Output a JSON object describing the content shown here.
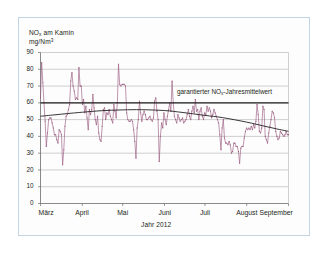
{
  "figure": {
    "frame_border_color": "#c3d5e2",
    "background_color": "#fdfdfd"
  },
  "chart_data": {
    "type": "line",
    "title": "",
    "ylabel_line1": "NOx am Kamin",
    "ylabel_line2": "mg/Nm3",
    "ylabel_line1_html": "NO<sub>x</sub> am Kamin",
    "ylabel_line2_html": "mg/Nm<sup>3</sup>",
    "xlabel": "Jahr 2012",
    "ylim": [
      0,
      90
    ],
    "yticks": [
      0,
      10,
      20,
      30,
      40,
      50,
      60,
      70,
      80,
      90
    ],
    "ytick_labels": [
      "0",
      "10",
      "20",
      "30",
      "40",
      "50",
      "60",
      "70",
      "80",
      "90"
    ],
    "xtick_labels": [
      "März",
      "April",
      "Mai",
      "Juni",
      "Juli",
      "August",
      "September"
    ],
    "xtick_positions_days": [
      0,
      31,
      61,
      92,
      122,
      153,
      184
    ],
    "x_range_days": [
      0,
      184
    ],
    "grid": "horizontal-only",
    "legend": "none",
    "series_color": "#9b5c82",
    "trend_color": "#221f1f",
    "threshold_color": "#221f1f",
    "annotations": [
      {
        "text": "garantierter NOx-Jahresmittelwert",
        "text_html": "garantierter NO<sub>x</sub>-Jahresmittelwert",
        "value": 60,
        "kind": "threshold-line-label"
      }
    ],
    "threshold_line": {
      "name": "garantierter NOx-Jahresmittelwert",
      "value": 60
    },
    "series": [
      {
        "name": "NOx am Kamin (Tagesmittelwerte)",
        "type": "line-with-markers",
        "color": "#9b5c82",
        "values": [
          63,
          84,
          72,
          60,
          49,
          34,
          42,
          50,
          51,
          51,
          48,
          45,
          41,
          41,
          38,
          36,
          44,
          43,
          41,
          23,
          32,
          46,
          52,
          53,
          56,
          59,
          73,
          78,
          70,
          67,
          62,
          63,
          62,
          81,
          70,
          70,
          59,
          62,
          54,
          58,
          51,
          44,
          56,
          53,
          56,
          65,
          57,
          50,
          47,
          52,
          42,
          38,
          37,
          46,
          56,
          57,
          50,
          54,
          53,
          56,
          52,
          50,
          48,
          59,
          55,
          51,
          60,
          83,
          71,
          70,
          71,
          71,
          71,
          70,
          54,
          50,
          49,
          49,
          50,
          49,
          44,
          37,
          27,
          45,
          50,
          61,
          54,
          49,
          53,
          55,
          53,
          50,
          50,
          51,
          52,
          50,
          49,
          51,
          61,
          63,
          55,
          50,
          25,
          40,
          48,
          45,
          54,
          50,
          47,
          52,
          56,
          60,
          55,
          73,
          60,
          52,
          50,
          48,
          53,
          51,
          49,
          50,
          51,
          48,
          49,
          50,
          53,
          56,
          52,
          50,
          55,
          58,
          54,
          62,
          55,
          56,
          50,
          55,
          57,
          52,
          50,
          54,
          53,
          58,
          55,
          57,
          55,
          51,
          53,
          56,
          54,
          52,
          50,
          48,
          41,
          32,
          45,
          50,
          39,
          36,
          36,
          35,
          37,
          35,
          30,
          31,
          36,
          36,
          34,
          34,
          31,
          24,
          33,
          34,
          34,
          39,
          43,
          45,
          44,
          45,
          44,
          46,
          44,
          47,
          45,
          49,
          59,
          53,
          43,
          42,
          45,
          58,
          56,
          40,
          38,
          36,
          42,
          46,
          50,
          55,
          54,
          51,
          43,
          40,
          38,
          39,
          43,
          42,
          41,
          40,
          41,
          43,
          41,
          41
        ]
      },
      {
        "name": "Trendlinie (gleitender Mittelwert)",
        "type": "smooth-trend",
        "color": "#221f1f",
        "points": [
          {
            "x_days": 0,
            "y": 52.0
          },
          {
            "x_days": 10,
            "y": 52.8
          },
          {
            "x_days": 20,
            "y": 53.6
          },
          {
            "x_days": 31,
            "y": 54.4
          },
          {
            "x_days": 45,
            "y": 55.3
          },
          {
            "x_days": 61,
            "y": 55.8
          },
          {
            "x_days": 75,
            "y": 55.9
          },
          {
            "x_days": 92,
            "y": 55.4
          },
          {
            "x_days": 105,
            "y": 54.3
          },
          {
            "x_days": 122,
            "y": 52.5
          },
          {
            "x_days": 135,
            "y": 51.2
          },
          {
            "x_days": 153,
            "y": 48.5
          },
          {
            "x_days": 165,
            "y": 46.3
          },
          {
            "x_days": 175,
            "y": 44.5
          },
          {
            "x_days": 184,
            "y": 43.0
          }
        ]
      }
    ]
  }
}
